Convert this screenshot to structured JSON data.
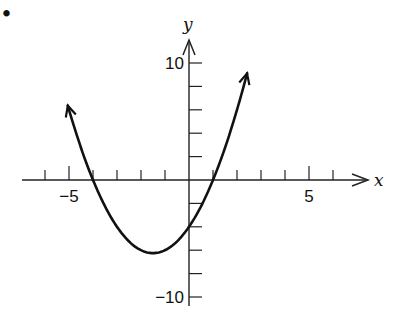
{
  "figure": {
    "bullet": "•"
  },
  "chart_data": {
    "type": "line",
    "title": "",
    "function": "y = x^2 + 3x - 4",
    "xlabel": "x",
    "ylabel": "y",
    "xlim": [
      -7,
      7.5
    ],
    "ylim": [
      -11,
      12
    ],
    "x_ticks": [
      -6,
      -5,
      -4,
      -3,
      -2,
      -1,
      1,
      2,
      3,
      4,
      5,
      6
    ],
    "x_tick_labels": [
      {
        "value": -5,
        "label": "−5"
      },
      {
        "value": 5,
        "label": "5"
      }
    ],
    "y_ticks": [
      -10,
      -8,
      -6,
      -4,
      -2,
      2,
      4,
      6,
      8,
      10
    ],
    "y_tick_labels": [
      {
        "value": 10,
        "label": "10"
      },
      {
        "value": -10,
        "label": "−10"
      }
    ],
    "grid": false,
    "series": [
      {
        "name": "parabola",
        "x": [
          -5.1,
          -4,
          -3,
          -2,
          -1.5,
          -1,
          0,
          1,
          2,
          2.4
        ],
        "y": [
          6.7,
          0,
          -4,
          -6,
          -6.25,
          -6,
          -4,
          0,
          6,
          8.96
        ]
      }
    ],
    "annotations": [
      {
        "text": "vertex",
        "x": -1.5,
        "y": -6.25
      },
      {
        "text": "roots",
        "x": [
          -4,
          1
        ]
      },
      {
        "text": "y-intercept",
        "x": 0,
        "y": -4
      }
    ]
  }
}
